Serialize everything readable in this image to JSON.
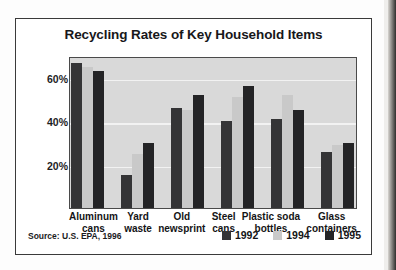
{
  "chart_data": {
    "type": "bar",
    "title": "Recycling Rates of Key Household Items",
    "xlabel": "",
    "ylabel": "",
    "ylim": [
      0,
      70
    ],
    "yticks": [
      20,
      40,
      60
    ],
    "ytick_labels": [
      "20%",
      "40%",
      "60%"
    ],
    "grid": true,
    "legend_position": "bottom-right",
    "categories": [
      "Aluminum cans",
      "Yard waste",
      "Old newsprint",
      "Steel cans",
      "Plastic soda bottles",
      "Glass containers"
    ],
    "category_lines": [
      [
        "Aluminum",
        "cans"
      ],
      [
        "Yard",
        "waste"
      ],
      [
        "Old",
        "newsprint"
      ],
      [
        "Steel",
        "cans"
      ],
      [
        "Plastic soda",
        "bottles"
      ],
      [
        "Glass",
        "containers"
      ]
    ],
    "series": [
      {
        "name": "1992",
        "color": "#343436",
        "values": [
          67,
          15,
          46,
          40,
          41,
          26
        ]
      },
      {
        "name": "1994",
        "color": "#c9c9c9",
        "values": [
          65,
          25,
          45,
          51,
          52,
          29
        ]
      },
      {
        "name": "1995",
        "color": "#242426",
        "values": [
          63,
          30,
          52,
          56,
          45,
          30
        ]
      }
    ],
    "source": "Source: U.S. EPA, 1996"
  },
  "figure": {
    "title": "Recycling Rates of Key Household Items",
    "source": "Source: U.S. EPA, 1996"
  },
  "legend": {
    "items": [
      {
        "label": "1992",
        "color": "#343436"
      },
      {
        "label": "1994",
        "color": "#c9c9c9"
      },
      {
        "label": "1995",
        "color": "#242426"
      }
    ]
  },
  "colors": {
    "panel_background": "#d9d9d9",
    "gridline": "#f2f2f2",
    "frame": "#3a3a3a",
    "series_1992": "#343436",
    "series_1994": "#c9c9c9",
    "series_1995": "#242426"
  }
}
